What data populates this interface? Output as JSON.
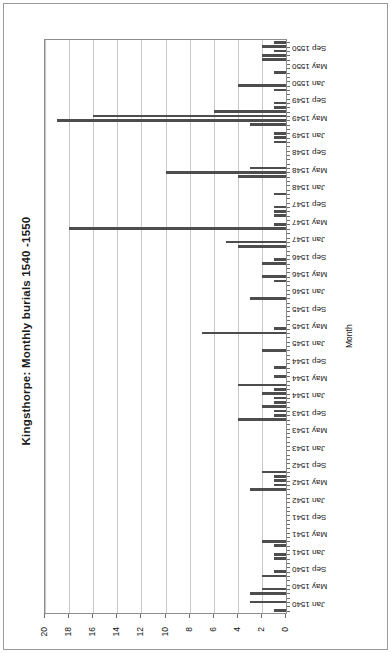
{
  "chart_data": {
    "type": "bar",
    "orientation": "horizontal-on-rotated-page",
    "title": "Kingsthorpe: Monthly burials 1540 -1550",
    "xlabel": "Month",
    "ylabel": "",
    "ylim": [
      0,
      20
    ],
    "ytick_step": 2,
    "ytick_labels": [
      "0",
      "2",
      "4",
      "6",
      "8",
      "10",
      "12",
      "14",
      "16",
      "18",
      "20"
    ],
    "grid": true,
    "legend": false,
    "bar_color": "#4d4d4d",
    "label_every_n_categories": 4,
    "categories": [
      "Jan 1540",
      "Feb 1540",
      "Mar 1540",
      "Apr 1540",
      "May 1540",
      "Jun 1540",
      "Jul 1540",
      "Aug 1540",
      "Sep 1540",
      "Oct 1540",
      "Nov 1540",
      "Dec 1540",
      "Jan 1541",
      "Feb 1541",
      "Mar 1541",
      "Apr 1541",
      "May 1541",
      "Jun 1541",
      "Jul 1541",
      "Aug 1541",
      "Sep 1541",
      "Oct 1541",
      "Nov 1541",
      "Dec 1541",
      "Jan 1542",
      "Feb 1542",
      "Mar 1542",
      "Apr 1542",
      "May 1542",
      "Jun 1542",
      "Jul 1542",
      "Aug 1542",
      "Sep 1542",
      "Oct 1542",
      "Nov 1542",
      "Dec 1542",
      "Jan 1543",
      "Feb 1543",
      "Mar 1543",
      "Apr 1543",
      "May 1543",
      "Jun 1543",
      "Jul 1543",
      "Aug 1543",
      "Sep 1543",
      "Oct 1543",
      "Nov 1543",
      "Dec 1543",
      "Jan 1544",
      "Feb 1544",
      "Mar 1544",
      "Apr 1544",
      "May 1544",
      "Jun 1544",
      "Jul 1544",
      "Aug 1544",
      "Sep 1544",
      "Oct 1544",
      "Nov 1544",
      "Dec 1544",
      "Jan 1545",
      "Feb 1545",
      "Mar 1545",
      "Apr 1545",
      "May 1545",
      "Jun 1545",
      "Jul 1545",
      "Aug 1545",
      "Sep 1545",
      "Oct 1545",
      "Nov 1545",
      "Dec 1545",
      "Jan 1546",
      "Feb 1546",
      "Mar 1546",
      "Apr 1546",
      "May 1546",
      "Jun 1546",
      "Jul 1546",
      "Aug 1546",
      "Sep 1546",
      "Oct 1546",
      "Nov 1546",
      "Dec 1546",
      "Jan 1547",
      "Feb 1547",
      "Mar 1547",
      "Apr 1547",
      "May 1547",
      "Jun 1547",
      "Jul 1547",
      "Aug 1547",
      "Sep 1547",
      "Oct 1547",
      "Nov 1547",
      "Dec 1547",
      "Jan 1548",
      "Feb 1548",
      "Mar 1548",
      "Apr 1548",
      "May 1548",
      "Jun 1548",
      "Jul 1548",
      "Aug 1548",
      "Sep 1548",
      "Oct 1548",
      "Nov 1548",
      "Dec 1548",
      "Jan 1549",
      "Feb 1549",
      "Mar 1549",
      "Apr 1549",
      "May 1549",
      "Jun 1549",
      "Jul 1549",
      "Aug 1549",
      "Sep 1549",
      "Oct 1549",
      "Nov 1549",
      "Dec 1549",
      "Jan 1550",
      "Feb 1550",
      "Mar 1550",
      "Apr 1550",
      "May 1550",
      "Jun 1550",
      "Jul 1550",
      "Aug 1550",
      "Sep 1550",
      "Oct 1550",
      "Nov 1550",
      "Dec 1550"
    ],
    "values": [
      1,
      0,
      3,
      0,
      3,
      2,
      0,
      0,
      2,
      1,
      0,
      0,
      1,
      1,
      0,
      1,
      2,
      0,
      0,
      0,
      0,
      0,
      0,
      0,
      0,
      0,
      0,
      0,
      3,
      1,
      1,
      1,
      2,
      0,
      0,
      0,
      0,
      0,
      0,
      0,
      0,
      0,
      0,
      0,
      4,
      1,
      1,
      2,
      1,
      1,
      2,
      1,
      4,
      0,
      1,
      0,
      1,
      0,
      0,
      0,
      2,
      0,
      0,
      0,
      7,
      1,
      0,
      0,
      0,
      0,
      0,
      0,
      3,
      0,
      0,
      0,
      1,
      2,
      0,
      0,
      2,
      1,
      0,
      0,
      4,
      5,
      0,
      0,
      18,
      1,
      0,
      1,
      1,
      1,
      0,
      0,
      1,
      0,
      0,
      0,
      4,
      10,
      3,
      0,
      0,
      0,
      0,
      0,
      1,
      1,
      1,
      0,
      3,
      19,
      16,
      6,
      1,
      1,
      0,
      0,
      1,
      4,
      0,
      0,
      1,
      0,
      0,
      2,
      2,
      1,
      2,
      1
    ]
  }
}
